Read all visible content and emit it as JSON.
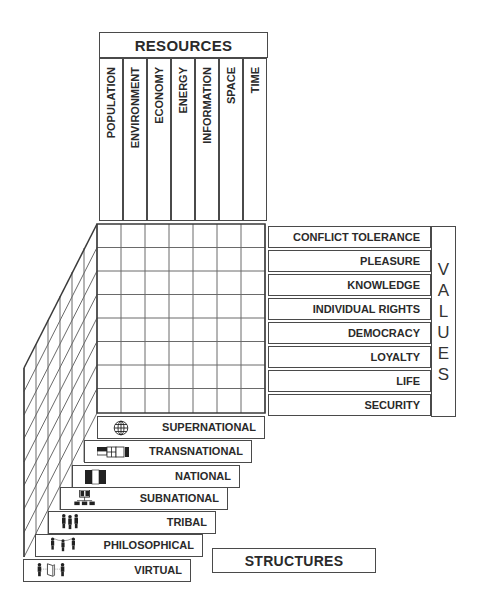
{
  "resources": {
    "title": "RESOURCES",
    "columns": [
      "POPULATION",
      "ENVIRONMENT",
      "ECONOMY",
      "ENERGY",
      "INFORMATION",
      "SPACE",
      "TIME"
    ]
  },
  "values": {
    "title": "VALUES",
    "letters": [
      "V",
      "A",
      "L",
      "U",
      "E",
      "S"
    ],
    "rows": [
      "CONFLICT TOLERANCE",
      "PLEASURE",
      "KNOWLEDGE",
      "INDIVIDUAL RIGHTS",
      "DEMOCRACY",
      "LOYALTY",
      "LIFE",
      "SECURITY"
    ]
  },
  "structures": {
    "title": "STRUCTURES",
    "levels": [
      {
        "label": "SUPERNATIONAL",
        "icon": "globe-icon"
      },
      {
        "label": "TRANSNATIONAL",
        "icon": "linked-flags-icon"
      },
      {
        "label": "NATIONAL",
        "icon": "flag-icon"
      },
      {
        "label": "SUBNATIONAL",
        "icon": "org-chart-icon"
      },
      {
        "label": "TRIBAL",
        "icon": "group-of-people-icon"
      },
      {
        "label": "PHILOSOPHICAL",
        "icon": "connected-people-icon"
      },
      {
        "label": "VIRTUAL",
        "icon": "people-via-device-icon"
      }
    ]
  },
  "colors": {
    "line": "#4a4a4a",
    "grid": "#6a6a6a",
    "text": "#2a2a2a",
    "background": "#ffffff"
  }
}
